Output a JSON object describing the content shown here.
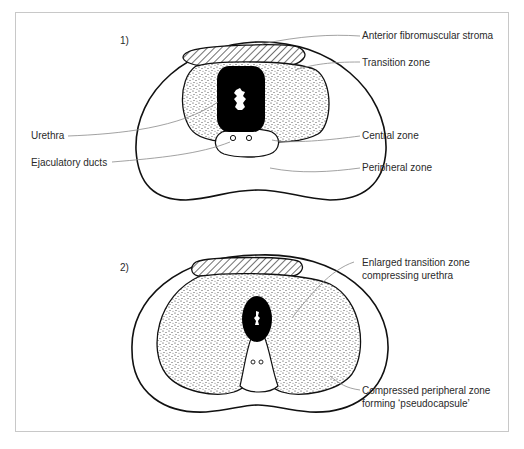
{
  "figure": {
    "panels": [
      {
        "id": "1",
        "label": "1)",
        "annotations": {
          "anterior_fibromuscular_stroma": "Anterior fibromuscular stroma",
          "transition_zone": "Transition zone",
          "urethra": "Urethra",
          "central_zone": "Central zone",
          "ejaculatory_ducts": "Ejaculatory ducts",
          "peripheral_zone": "Peripheral zone"
        }
      },
      {
        "id": "2",
        "label": "2)",
        "annotations": {
          "enlarged_tz_line1": "Enlarged transition zone",
          "enlarged_tz_line2": "compressing urethra",
          "compressed_pz_line1": "Compressed peripheral zone",
          "compressed_pz_line2": "forming ‘pseudocapsule’"
        }
      }
    ],
    "colors": {
      "outline": "#111111",
      "leader_line": "#8a8a8a",
      "frame": "#c8c8c8",
      "urethra_fill": "#000000",
      "stipple": "#222222"
    }
  }
}
